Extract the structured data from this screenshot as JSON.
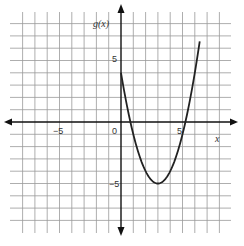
{
  "chart_data": {
    "type": "line",
    "title": "",
    "function_label": "g(x)",
    "xlabel": "x",
    "ylabel": "g(x)",
    "xlim": [
      -9,
      9
    ],
    "ylim": [
      -9,
      9
    ],
    "grid": true,
    "tick_labels": {
      "x": [
        "-5",
        "5"
      ],
      "y": [
        "5",
        "-5"
      ],
      "origin": "0"
    },
    "series": [
      {
        "name": "g(x)",
        "equation": "g(x) = (x - 3)^2 - 5",
        "x_range": [
          0,
          6.4
        ],
        "points": [
          [
            0,
            4
          ],
          [
            0.76,
            0
          ],
          [
            1,
            -1
          ],
          [
            2,
            -4
          ],
          [
            3,
            -5
          ],
          [
            4,
            -4
          ],
          [
            5,
            -1
          ],
          [
            5.24,
            0
          ],
          [
            6,
            4
          ],
          [
            6.4,
            6.56
          ]
        ],
        "vertex": [
          3,
          -5
        ],
        "y_intercept": 4,
        "x_intercepts": [
          0.76,
          5.24
        ]
      }
    ]
  },
  "labels": {
    "y_axis": "g(x)",
    "x_axis": "x",
    "origin": "0",
    "x_neg5": "−5",
    "x_pos5": "5",
    "y_pos5": "5",
    "y_neg5": "−5"
  }
}
